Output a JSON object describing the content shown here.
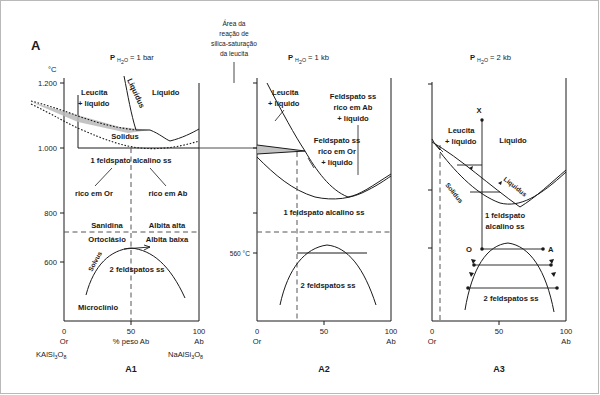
{
  "figure": {
    "label": "A",
    "top_note": [
      "Área da",
      "reação de",
      "silica-saturação",
      "da leucita"
    ],
    "axis_temp_unit": "°C",
    "panels": [
      {
        "id": "A1",
        "caption": "A1",
        "pressure": {
          "p": "P",
          "sub": "H",
          "sub2": "2",
          "sub3": "O",
          "value": "= 1 bar",
          "full": "PH2O = 1 bar"
        },
        "y_ticks": [
          "1.200",
          "1.000",
          "800",
          "600"
        ],
        "x_ticks": [
          "0",
          "50",
          "100"
        ],
        "x_left_label": "Or",
        "x_right_label": "Ab",
        "x_axis_title": "% peso Ab",
        "x_left_formula": "KAlSi3O8",
        "x_right_formula": "NaAlSi3O8",
        "fields": [
          "Leucita\n+ líquido",
          "Líquido",
          "Liquidus",
          "Solidus",
          "1 feldspato alcalino ss",
          "rico em Or",
          "rico em Ab",
          "Sanidina",
          "Albita alta",
          "Ortoclásio",
          "Albita baixa",
          "Solvus",
          "2 feldspatos ss",
          "Microclínio"
        ],
        "labels": {
          "leucita_liquido": "Leucita\n+ líquido",
          "leucita_l1": "Leucita",
          "leucita_l2": "+ líquido",
          "liquido": "Líquido",
          "liquidus": "Liquidus",
          "solidus": "Solidus",
          "one_feldspar": "1 feldspato alcalino ss",
          "rico_or": "rico em Or",
          "rico_ab": "rico em Ab",
          "sanidina": "Sanidina",
          "albita_alta": "Albita alta",
          "ortoclasio": "Ortoclásio",
          "albita_baixa": "Albita baixa",
          "solvus": "Solvus",
          "two_feldspars": "2 feldspatos ss",
          "microclinio": "Microclínio"
        }
      },
      {
        "id": "A2",
        "caption": "A2",
        "pressure": {
          "full": "PH2O = 1 kb",
          "value": "= 1 kb"
        },
        "x_ticks": [
          "0",
          "50",
          "100"
        ],
        "x_left_label": "Or",
        "x_right_label": "Ab",
        "temp_marker": "560 °C",
        "labels": {
          "leucita_l1": "Leucita",
          "leucita_l2": "+ líquido",
          "fsp_ab_l1": "Feldspato ss",
          "fsp_ab_l2": "rico em Ab",
          "fsp_ab_l3": "+ líquido",
          "fsp_or_l1": "Feldspato ss",
          "fsp_or_l2": "rico em Or",
          "fsp_or_l3": "+ líquido",
          "one_feldspar": "1 feldspato alcalino ss",
          "two_feldspars": "2 feldspatos ss"
        }
      },
      {
        "id": "A3",
        "caption": "A3",
        "pressure": {
          "full": "PH2O = 2 kb",
          "value": "= 2 kb"
        },
        "x_ticks": [
          "0",
          "50",
          "100"
        ],
        "x_left_label": "Or",
        "x_right_label": "Ab",
        "point_markers": [
          "X",
          "O",
          "A"
        ],
        "labels": {
          "leucita_l1": "Leucita",
          "leucita_l2": "+ líquido",
          "liquido": "Líquido",
          "liquidus": "Liquidus",
          "solidus": "Solidus",
          "one_feldspar_l1": "1 feldspato",
          "one_feldspar_l2": "alcalino ss",
          "two_feldspars": "2 feldspatos ss",
          "pt_x": "X",
          "pt_o": "O",
          "pt_a": "A"
        }
      }
    ]
  },
  "colors": {
    "ink": "#1a1a1a",
    "shade": "#b9b9b9",
    "dash": "#555555",
    "frame": "#b9b9b9"
  }
}
